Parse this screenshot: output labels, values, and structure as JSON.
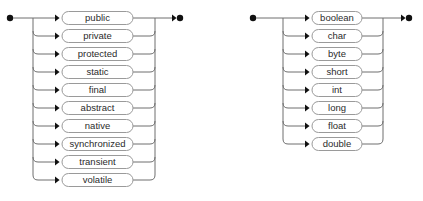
{
  "page": {
    "background_color": "#ffffff",
    "width": 423,
    "height": 201
  },
  "style": {
    "rail_color": "#6e6e6e",
    "box_stroke_color": "#9a9a9a",
    "box_fill_color": "#ffffff",
    "text_color": "#2b2b2b",
    "terminal_color": "#111111"
  },
  "diagrams": [
    {
      "name": "modifier",
      "origin_x": 10,
      "origin_y": 18,
      "start_dot_x": 10,
      "fan_x": 33,
      "arrow_x": 55,
      "box_x": 62,
      "box_width": 71,
      "box_height": 13,
      "merge_x": 155,
      "end_arrow_x": 172,
      "end_dot_x": 180,
      "row_height": 18,
      "alternatives": [
        {
          "label": "public"
        },
        {
          "label": "private"
        },
        {
          "label": "protected"
        },
        {
          "label": "static"
        },
        {
          "label": "final"
        },
        {
          "label": "abstract"
        },
        {
          "label": "native"
        },
        {
          "label": "synchronized"
        },
        {
          "label": "transient"
        },
        {
          "label": "volatile"
        }
      ]
    },
    {
      "name": "primitive-type",
      "origin_x": 253,
      "origin_y": 18,
      "start_dot_x": 253,
      "fan_x": 283,
      "arrow_x": 305,
      "box_x": 312,
      "box_width": 50,
      "box_height": 13,
      "merge_x": 383,
      "end_arrow_x": 401,
      "end_dot_x": 409,
      "row_height": 18,
      "alternatives": [
        {
          "label": "boolean"
        },
        {
          "label": "char"
        },
        {
          "label": "byte"
        },
        {
          "label": "short"
        },
        {
          "label": "int"
        },
        {
          "label": "long"
        },
        {
          "label": "float"
        },
        {
          "label": "double"
        }
      ]
    }
  ]
}
